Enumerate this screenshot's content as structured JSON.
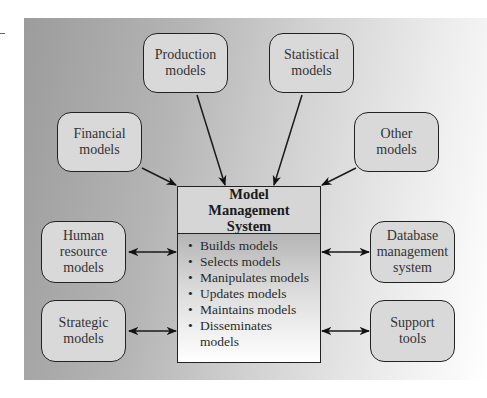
{
  "diagram": {
    "center": {
      "title": "Model Management System",
      "functions": [
        "Builds models",
        "Selects models",
        "Manipulates models",
        "Updates models",
        "Maintains models",
        "Disseminates models"
      ]
    },
    "inputs": [
      {
        "id": "financial",
        "lines": [
          "Financial",
          "models"
        ],
        "arrow": "one-way"
      },
      {
        "id": "production",
        "lines": [
          "Production",
          "models"
        ],
        "arrow": "one-way"
      },
      {
        "id": "statistical",
        "lines": [
          "Statistical",
          "models"
        ],
        "arrow": "one-way"
      },
      {
        "id": "other",
        "lines": [
          "Other",
          "models"
        ],
        "arrow": "one-way"
      }
    ],
    "bidirectional": [
      {
        "id": "human-resource",
        "lines": [
          "Human",
          "resource",
          "models"
        ],
        "arrow": "two-way"
      },
      {
        "id": "strategic",
        "lines": [
          "Strategic",
          "models"
        ],
        "arrow": "two-way"
      },
      {
        "id": "database",
        "lines": [
          "Database",
          "management",
          "system"
        ],
        "arrow": "two-way"
      },
      {
        "id": "support",
        "lines": [
          "Support",
          "tools"
        ],
        "arrow": "two-way"
      }
    ]
  },
  "colors": {
    "panel_left": "#9c9c9c",
    "panel_right": "#ffffff",
    "node_fill": "#d9d9d9",
    "stroke": "#222222"
  }
}
